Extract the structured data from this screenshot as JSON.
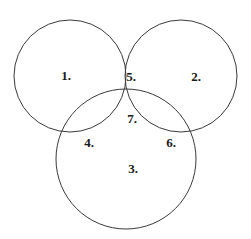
{
  "diagram": {
    "type": "venn",
    "background_color": "#ffffff",
    "stroke_color": "#3a3a3a",
    "stroke_width": 1,
    "label_color": "#1a1a1a",
    "canvas": {
      "width": 251,
      "height": 239
    },
    "circles": [
      {
        "name": "left-circle",
        "cx": 70,
        "cy": 76,
        "r": 56
      },
      {
        "name": "right-circle",
        "cx": 181,
        "cy": 76,
        "r": 56
      },
      {
        "name": "bottom-circle",
        "cx": 126,
        "cy": 159,
        "r": 70
      }
    ],
    "regions": [
      {
        "id": "region-1",
        "label": "1.",
        "x": 66,
        "y": 75,
        "belongs_to": [
          "left"
        ]
      },
      {
        "id": "region-2",
        "label": "2.",
        "x": 196,
        "y": 76,
        "belongs_to": [
          "right"
        ]
      },
      {
        "id": "region-3",
        "label": "3.",
        "x": 133,
        "y": 168,
        "belongs_to": [
          "bottom"
        ]
      },
      {
        "id": "region-4",
        "label": "4.",
        "x": 89,
        "y": 142,
        "belongs_to": [
          "left",
          "bottom"
        ]
      },
      {
        "id": "region-5",
        "label": "5.",
        "x": 131,
        "y": 76,
        "belongs_to": [
          "left",
          "right"
        ]
      },
      {
        "id": "region-6",
        "label": "6.",
        "x": 171,
        "y": 142,
        "belongs_to": [
          "right",
          "bottom"
        ]
      },
      {
        "id": "region-7",
        "label": "7.",
        "x": 132,
        "y": 118,
        "belongs_to": [
          "left",
          "right",
          "bottom"
        ]
      }
    ]
  }
}
